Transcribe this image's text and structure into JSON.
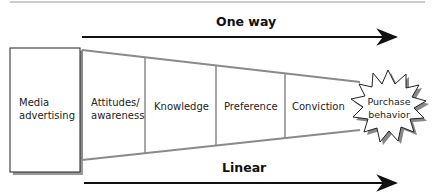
{
  "diagram": {
    "top_label": "One way",
    "bottom_label": "Linear",
    "source_box": {
      "line1": "Media",
      "line2": "advertising"
    },
    "stages": [
      {
        "line1": "Attitudes/",
        "line2": "awareness"
      },
      {
        "line1": "Knowledge",
        "line2": ""
      },
      {
        "line1": "Preference",
        "line2": ""
      },
      {
        "line1": "Conviction",
        "line2": ""
      }
    ],
    "outcome": {
      "line1": "Purchase",
      "line2": "behavior"
    },
    "colors": {
      "funnel_line": "#8a8a8a",
      "arrow": "#111111",
      "shadow": "#888888"
    }
  }
}
